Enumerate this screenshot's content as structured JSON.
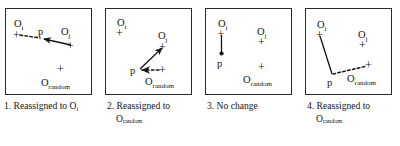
{
  "figure": {
    "background": "#ffffff",
    "ink": "#141414",
    "panel_count": 4
  },
  "labels": {
    "oi": "O",
    "oi_sub": "i",
    "oj": "O",
    "oj_sub": "j",
    "orandom": "O",
    "orandom_sub": "random",
    "p": "p",
    "plus": "+"
  },
  "panels": [
    {
      "id": "panel-1",
      "number": "1.",
      "caption_line1": "1. Reassigned to O",
      "caption_sub1": "i",
      "caption_line2": "",
      "caption_sub2": "",
      "nodes": {
        "oi": {
          "x": 11,
          "y": 25,
          "label_x": 9,
          "label_y": 16
        },
        "oj": {
          "x": 66,
          "y": 35,
          "label_x": 58,
          "label_y": 26
        },
        "orandom": {
          "x": 55,
          "y": 60,
          "label_x": 38,
          "label_y": 74
        },
        "p": {
          "x": 38,
          "y": 28,
          "label_x": 33,
          "label_y": 24
        }
      },
      "edges": [
        {
          "from": "oi",
          "to": "p",
          "style": "dashed",
          "arrow": "none"
        },
        {
          "from": "oj",
          "to": "p",
          "style": "solid",
          "arrow": "to"
        }
      ]
    },
    {
      "id": "panel-2",
      "number": "2.",
      "caption_line1": "2. Reassigned to",
      "caption_sub1": "",
      "caption_line2": "O",
      "caption_sub2": "random",
      "nodes": {
        "oi": {
          "x": 14,
          "y": 23,
          "label_x": 11,
          "label_y": 15
        },
        "oj": {
          "x": 58,
          "y": 39,
          "label_x": 53,
          "label_y": 30
        },
        "orandom": {
          "x": 56,
          "y": 62,
          "label_x": 41,
          "label_y": 74
        },
        "p": {
          "x": 34,
          "y": 62,
          "label_x": 27,
          "label_y": 66
        }
      },
      "edges": [
        {
          "from": "p",
          "to": "oj",
          "style": "solid",
          "arrow": "to"
        },
        {
          "from": "orandom",
          "to": "p",
          "style": "dashed",
          "arrow": "to"
        }
      ]
    },
    {
      "id": "panel-3",
      "number": "3.",
      "caption_line1": "3. No change",
      "caption_sub1": "",
      "caption_line2": "",
      "caption_sub2": "",
      "nodes": {
        "oi": {
          "x": 16,
          "y": 24,
          "label_x": 13,
          "label_y": 15
        },
        "oj": {
          "x": 57,
          "y": 33,
          "label_x": 52,
          "label_y": 25
        },
        "orandom": {
          "x": 56,
          "y": 59,
          "label_x": 40,
          "label_y": 72
        },
        "p": {
          "x": 16,
          "y": 45,
          "label_x": 12,
          "label_y": 57
        }
      },
      "edges": [
        {
          "from": "oi",
          "to": "p",
          "style": "solid",
          "arrow": "none"
        }
      ]
    },
    {
      "id": "panel-4",
      "number": "4.",
      "caption_line1": "4. Reassigned to",
      "caption_sub1": "",
      "caption_line2": "O",
      "caption_sub2": "random",
      "nodes": {
        "oi": {
          "x": 16,
          "y": 25,
          "label_x": 13,
          "label_y": 16
        },
        "oj": {
          "x": 58,
          "y": 35,
          "label_x": 53,
          "label_y": 27
        },
        "orandom": {
          "x": 64,
          "y": 58,
          "label_x": 44,
          "label_y": 72
        },
        "p": {
          "x": 28,
          "y": 67,
          "label_x": 23,
          "label_y": 78
        }
      },
      "edges": [
        {
          "from": "oi",
          "to": "p",
          "style": "solid",
          "arrow": "none"
        },
        {
          "from": "p",
          "to": "orandom",
          "style": "dashed",
          "arrow": "none"
        }
      ]
    }
  ]
}
